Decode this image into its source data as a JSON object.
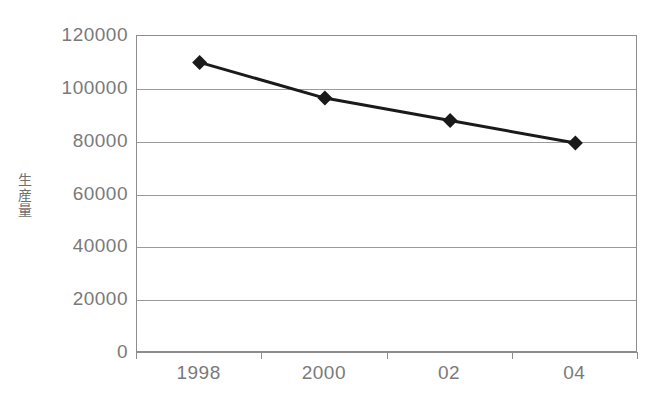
{
  "chart_data": {
    "type": "line",
    "title": "",
    "xlabel": "",
    "ylabel": "生産量",
    "categories": [
      "1998",
      "2000",
      "02",
      "04"
    ],
    "values": [
      110000,
      96500,
      88000,
      79500
    ],
    "series": [
      {
        "name": "生産量",
        "values": [
          110000,
          96500,
          88000,
          79500
        ]
      }
    ],
    "ylim": [
      0,
      120000
    ],
    "y_ticks": [
      0,
      20000,
      40000,
      60000,
      80000,
      100000,
      120000
    ],
    "y_tick_labels": [
      "0",
      "20000",
      "40000",
      "60000",
      "80000",
      "100000",
      "120000"
    ],
    "x_tick_labels": [
      "1998",
      "2000",
      "02",
      "04"
    ],
    "grid": "horizontal",
    "legend": "none",
    "marker": "diamond",
    "line_color": "#1a1a1a",
    "marker_color": "#1a1a1a",
    "grid_color": "#9a9a9a",
    "axis_color": "#8d8d8d",
    "text_color": "#7a7a7a",
    "background": "#ffffff"
  }
}
